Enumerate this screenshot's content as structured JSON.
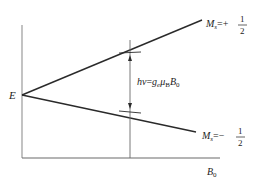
{
  "diagram": {
    "type": "energy-level-splitting",
    "origin_label": "E",
    "x_axis_label": "B",
    "x_axis_label_sub": "0",
    "upper_level": {
      "label_main": "M",
      "label_sub": "s",
      "label_eq": "=+",
      "frac_num": "1",
      "frac_den": "2"
    },
    "lower_level": {
      "label_main": "M",
      "label_sub": "s",
      "label_eq": "=−",
      "frac_num": "1",
      "frac_den": "2"
    },
    "transition": {
      "lhs": "hν",
      "eq": "=",
      "g": "g",
      "g_sub": "e",
      "mu": "μ",
      "mu_sub": "B",
      "B": "B",
      "B_sub": "0"
    },
    "colors": {
      "axis": "#9a9a9a",
      "line": "#2a2a2a",
      "text": "#222222"
    }
  }
}
